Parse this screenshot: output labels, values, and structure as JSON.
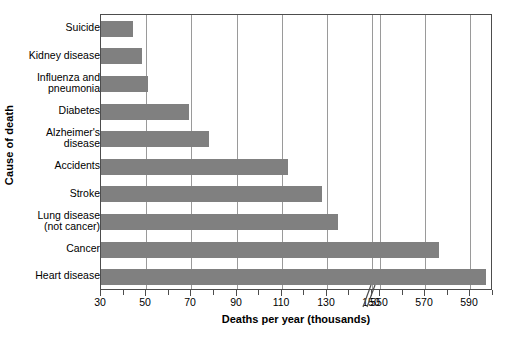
{
  "chart_data": {
    "type": "bar",
    "orientation": "horizontal",
    "title": "",
    "xlabel": "Deaths per year (thousands)",
    "ylabel": "Cause of death",
    "categories": [
      "Suicide",
      "Kidney disease",
      "Influenza and\npneumonia",
      "Diabetes",
      "Alzheimer's\ndisease",
      "Accidents",
      "Stroke",
      "Lung disease\n(not cancer)",
      "Cancer",
      "Heart disease"
    ],
    "values": [
      44,
      48,
      51,
      69,
      78,
      113,
      128,
      135,
      576,
      597
    ],
    "bar_color": "#808080",
    "grid": true,
    "grid_axis": "x",
    "axis_break": true,
    "axis_break_between": [
      150,
      550
    ],
    "xlim_segments": [
      [
        30,
        150
      ],
      [
        550,
        600
      ]
    ],
    "tick_labels": [
      "30",
      "50",
      "70",
      "90",
      "110",
      "130",
      "150",
      "550",
      "570",
      "590"
    ],
    "tick_values": [
      30,
      50,
      70,
      90,
      110,
      130,
      150,
      550,
      570,
      590
    ],
    "minor_tick_step": 10,
    "legend": null
  },
  "axis": {
    "x_title": "Deaths per year (thousands)",
    "y_title": "Cause of death"
  },
  "colors": {
    "bar": "#808080",
    "grid": "#9a9a9a",
    "frame": "#4d4d4d",
    "background": "#ffffff",
    "text": "#000000"
  }
}
